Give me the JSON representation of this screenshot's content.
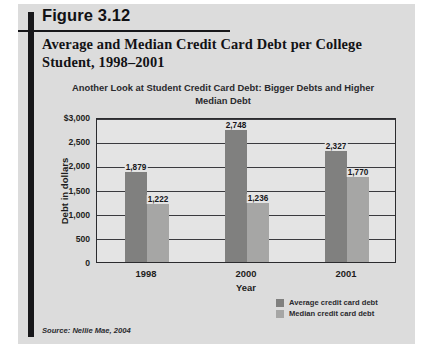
{
  "figure": {
    "number": "Figure 3.12",
    "title": "Average and Median Credit Card Debt per College Student, 1998–2001",
    "source": "Source: Nellie Mae, 2004"
  },
  "legend": {
    "position": "bottom-right",
    "items": [
      {
        "label": "Average credit card debt",
        "color": "#80807f",
        "swatch_name": "legend-swatch-average"
      },
      {
        "label": "Median credit card debt",
        "color": "#a6a6a5",
        "swatch_name": "legend-swatch-median"
      }
    ]
  },
  "chart_data": {
    "type": "bar",
    "title": "Another Look at Student Credit Card Debt: Bigger Debts and Higher Median Debt",
    "xlabel": "Year",
    "ylabel": "Debt in dollars",
    "categories": [
      "1998",
      "2000",
      "2001"
    ],
    "series": [
      {
        "name": "Average credit card debt",
        "color": "#80807f",
        "values": [
          1879,
          2748,
          2327
        ],
        "labels": [
          "1,879",
          "2,748",
          "2,327"
        ]
      },
      {
        "name": "Median credit card debt",
        "color": "#a6a6a5",
        "values": [
          1222,
          1236,
          1770
        ],
        "labels": [
          "1,222",
          "1,236",
          "1,770"
        ]
      }
    ],
    "ylim": [
      0,
      3000
    ],
    "yticks": [
      0,
      500,
      1000,
      1500,
      2000,
      2500,
      3000
    ],
    "ytick_labels": [
      "0",
      "500",
      "1,000",
      "1,500",
      "2,000",
      "2,500",
      "$3,000"
    ],
    "grid": true,
    "grid_axis": "y",
    "legend_position": "bottom-right"
  }
}
